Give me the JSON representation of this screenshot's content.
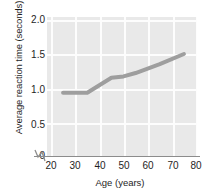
{
  "chart_data": {
    "type": "line",
    "title": "",
    "xlabel": "Age (years)",
    "ylabel": "Average reaction time (seconds)",
    "xlim": [
      20,
      80
    ],
    "ylim": [
      0,
      2.0
    ],
    "grid": true,
    "legend": null,
    "x_ticks": [
      "20",
      "30",
      "40",
      "50",
      "60",
      "70",
      "80"
    ],
    "x_tick_values": [
      20,
      30,
      40,
      50,
      60,
      70,
      80
    ],
    "y_ticks": [
      "0",
      "0.5",
      "1.0",
      "1.5",
      "2.0"
    ],
    "y_tick_values": [
      0,
      0.5,
      1.0,
      1.5,
      2.0
    ],
    "x_axis_break": true,
    "x": [
      25,
      35,
      45,
      50,
      55,
      65,
      75
    ],
    "values": [
      0.93,
      0.93,
      1.15,
      1.17,
      1.22,
      1.35,
      1.5
    ],
    "series": [
      {
        "name": "Average reaction time",
        "x": [
          25,
          35,
          45,
          50,
          55,
          65,
          75
        ],
        "values": [
          0.93,
          0.93,
          1.15,
          1.17,
          1.22,
          1.35,
          1.5
        ]
      }
    ],
    "colors": {
      "line": "#9e9e9e",
      "plot_background": "#e9e9e9",
      "gridline": "#fdfdfd",
      "axis": "#8c8c8c",
      "text": "#1e1e1e"
    }
  },
  "axes": {
    "y_title": "Average reaction time (seconds)",
    "x_title": "Age (years)"
  }
}
